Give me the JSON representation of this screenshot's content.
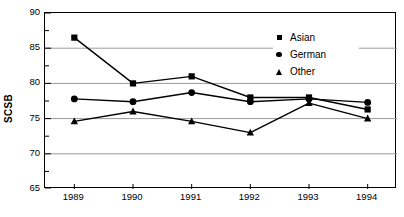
{
  "chart_data": {
    "type": "line",
    "title": "",
    "xlabel": "",
    "ylabel": "SCSB",
    "categories": [
      "1989",
      "1990",
      "1991",
      "1992",
      "1993",
      "1994"
    ],
    "ylim": [
      65,
      90
    ],
    "yticks": [
      65,
      70,
      75,
      80,
      85,
      90
    ],
    "yminorticks": [
      67.5,
      72.5,
      77.5,
      82.5,
      87.5
    ],
    "grid": "horizontal-major",
    "legend_position": "top-right-inside",
    "series": [
      {
        "name": "Asian",
        "marker": "square",
        "color": "#000000",
        "values": [
          86.5,
          80.0,
          81.0,
          78.0,
          78.0,
          76.3
        ]
      },
      {
        "name": "German",
        "marker": "circle",
        "color": "#000000",
        "values": [
          77.8,
          77.4,
          78.7,
          77.4,
          77.8,
          77.3
        ]
      },
      {
        "name": "Other",
        "marker": "triangle",
        "color": "#000000",
        "values": [
          74.6,
          76.0,
          74.6,
          73.0,
          77.2,
          75.0
        ]
      }
    ]
  },
  "axis": {
    "y_title": "SCSB",
    "y_tick_labels": [
      "90",
      "85",
      "80",
      "75",
      "70",
      "65"
    ],
    "x_tick_labels": [
      "1989",
      "1990",
      "1991",
      "1992",
      "1993",
      "1994"
    ]
  },
  "legend": {
    "items": [
      {
        "label": "Asian",
        "marker": "square-marker"
      },
      {
        "label": "German",
        "marker": "circle-marker"
      },
      {
        "label": "Other",
        "marker": "triangle-marker"
      }
    ]
  },
  "colors": {
    "ink": "#000000",
    "gridline": "#9a9a9a",
    "frame": "#000000",
    "background": "#ffffff"
  }
}
